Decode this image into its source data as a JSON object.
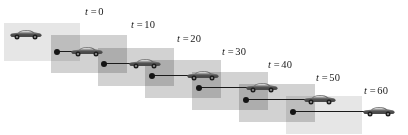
{
  "figure": {
    "width": 408,
    "height": 135,
    "background_color": "#ffffff",
    "panel_color": "#d2d2d2",
    "panel_light_color": "#e6e6e6",
    "car_color": "#555555",
    "line_color": "#1b1b1b"
  },
  "chart_data": {
    "type": "scatter",
    "title": "",
    "xlabel": "",
    "ylabel": "",
    "variable": "t",
    "categories": [
      "t = 0",
      "t = 10",
      "t = 20",
      "t = 30",
      "t = 40",
      "t = 50",
      "t = 60"
    ],
    "x": [
      0,
      10,
      20,
      30,
      40,
      50,
      60
    ],
    "values": [
      0,
      1,
      2,
      3,
      4,
      5,
      6
    ],
    "grid": false,
    "legend": "none"
  },
  "frames": [
    {
      "label_t": "t",
      "label_eq": "=",
      "label_value": "0",
      "label_x": 85,
      "label_y": 6,
      "panel_x": 4,
      "panel_y": 23,
      "panel_w": 76,
      "panel_h": 38,
      "panel_shade": "light",
      "car_x": 9,
      "car_y": 28,
      "has_measure": false,
      "measure_x": 0,
      "measure_y": 0,
      "measure_w": 0
    },
    {
      "label_t": "t",
      "label_eq": "=",
      "label_value": "10",
      "label_x": 131,
      "label_y": 19,
      "panel_x": 51,
      "panel_y": 35,
      "panel_w": 76,
      "panel_h": 38,
      "panel_shade": "dark",
      "car_x": 70,
      "car_y": 45,
      "has_measure": true,
      "measure_x": 54,
      "measure_y": 48,
      "measure_w": 26
    },
    {
      "label_t": "t",
      "label_eq": "=",
      "label_value": "20",
      "label_x": 177,
      "label_y": 33,
      "panel_x": 98,
      "panel_y": 48,
      "panel_w": 76,
      "panel_h": 38,
      "panel_shade": "dark",
      "car_x": 128,
      "car_y": 57,
      "has_measure": true,
      "measure_x": 101,
      "measure_y": 60,
      "measure_w": 37
    },
    {
      "label_t": "t",
      "label_eq": "=",
      "label_value": "30",
      "label_x": 222,
      "label_y": 46,
      "panel_x": 145,
      "panel_y": 60,
      "panel_w": 76,
      "panel_h": 38,
      "panel_shade": "dark",
      "car_x": 186,
      "car_y": 69,
      "has_measure": true,
      "measure_x": 149,
      "measure_y": 72,
      "measure_w": 47
    },
    {
      "label_t": "t",
      "label_eq": "=",
      "label_value": "40",
      "label_x": 268,
      "label_y": 59,
      "panel_x": 192,
      "panel_y": 72,
      "panel_w": 76,
      "panel_h": 38,
      "panel_shade": "dark",
      "car_x": 245,
      "car_y": 81,
      "has_measure": true,
      "measure_x": 196,
      "measure_y": 84,
      "measure_w": 57
    },
    {
      "label_t": "t",
      "label_eq": "=",
      "label_value": "50",
      "label_x": 316,
      "label_y": 72,
      "panel_x": 239,
      "panel_y": 84,
      "panel_w": 76,
      "panel_h": 38,
      "panel_shade": "dark",
      "car_x": 303,
      "car_y": 93,
      "has_measure": true,
      "measure_x": 243,
      "measure_y": 96,
      "measure_w": 68
    },
    {
      "label_t": "t",
      "label_eq": "=",
      "label_value": "60",
      "label_x": 364,
      "label_y": 85,
      "panel_x": 286,
      "panel_y": 96,
      "panel_w": 76,
      "panel_h": 38,
      "panel_shade": "light",
      "car_x": 362,
      "car_y": 105,
      "has_measure": true,
      "measure_x": 290,
      "measure_y": 108,
      "measure_w": 78
    }
  ]
}
